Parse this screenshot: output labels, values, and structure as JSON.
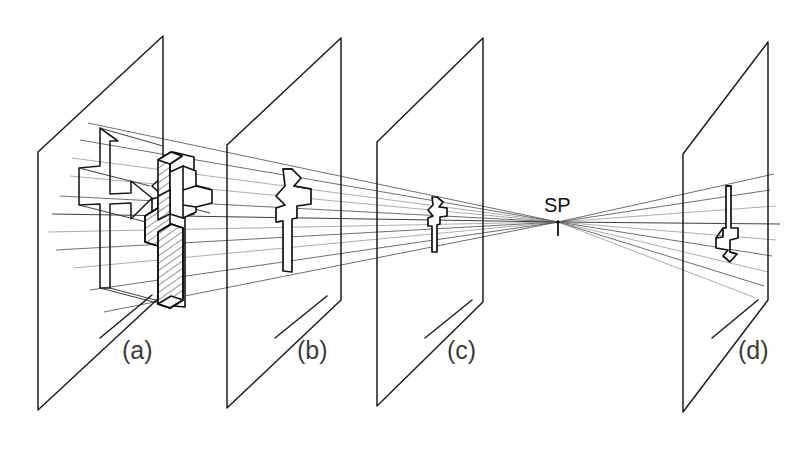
{
  "figure": {
    "background_color": "#ffffff",
    "line_color": "#1d1d1d",
    "ray_color": "#4a4a4a",
    "width": 797,
    "height": 451
  },
  "station_point": {
    "label": "SP",
    "label_x": 544,
    "label_y": 212,
    "x": 558,
    "y": 222,
    "tick_length": 14
  },
  "planes": [
    {
      "id": "a",
      "label": "(a)",
      "label_x": 122,
      "label_y": 359,
      "left_x": 38,
      "right_x": 163,
      "top_right_y": 36,
      "left_top_y": 152,
      "left_bottom_y": 410,
      "right_bottom_y": 294,
      "object_kind": "solid-hatched-and-ghost",
      "object_scale": 1.0
    },
    {
      "id": "b",
      "label": "(b)",
      "label_x": 297,
      "label_y": 359,
      "left_x": 227,
      "right_x": 341,
      "top_right_y": 38,
      "left_top_y": 145,
      "left_bottom_y": 408,
      "right_bottom_y": 300,
      "object_kind": "silhouette",
      "object_scale": 0.48
    },
    {
      "id": "c",
      "label": "(c)",
      "label_x": 447,
      "label_y": 359,
      "left_x": 377,
      "right_x": 483,
      "top_right_y": 38,
      "left_top_y": 142,
      "left_bottom_y": 406,
      "right_bottom_y": 302,
      "object_kind": "silhouette",
      "object_scale": 0.25
    },
    {
      "id": "d",
      "label": "(d)",
      "label_x": 738,
      "label_y": 359,
      "left_x": 683,
      "right_x": 768,
      "top_right_y": 42,
      "left_top_y": 154,
      "left_bottom_y": 412,
      "right_bottom_y": 300,
      "object_kind": "silhouette-inverted",
      "object_scale": 0.36
    }
  ],
  "objects": {
    "solid_object_a": {
      "name": "hatched-stepped-block",
      "description": "Extruded stepped cross-shaped solid with hatched side faces",
      "x": 150,
      "y": 145,
      "width": 62,
      "height": 160
    },
    "ghost_outline_a": {
      "name": "wireframe-ghost-silhouette",
      "description": "Thin wireframe outline of the object projected onto picture plane (a)",
      "x": 68,
      "y": 128,
      "width": 98,
      "height": 160
    },
    "silhouette_b": {
      "name": "projected-silhouette-b",
      "x": 276,
      "y": 170,
      "width": 36,
      "height": 102
    },
    "silhouette_c": {
      "name": "projected-silhouette-c",
      "x": 428,
      "y": 196,
      "width": 20,
      "height": 56
    },
    "silhouette_d": {
      "name": "projected-silhouette-d-inverted",
      "x": 712,
      "y": 186,
      "width": 26,
      "height": 76
    }
  },
  "ray_bundle": {
    "description": "Straight projection rays running from the object on plane (a) through planes (b) and (c), crossing at SP, and diverging to the inverted image on plane (d)",
    "left_count": 11,
    "right_count": 9
  }
}
